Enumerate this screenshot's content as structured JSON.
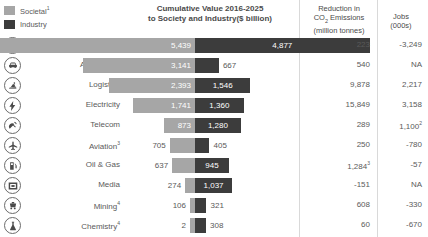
{
  "legend": {
    "items": [
      {
        "label": "Societal",
        "note": "1",
        "color": "#a6a6a6",
        "name": "societal"
      },
      {
        "label": "Industry",
        "note": "",
        "color": "#3c3c3c",
        "name": "industry"
      }
    ]
  },
  "headers": {
    "center_line1": "Cumulative Value 2016-2025",
    "center_line2": "to Society and Industry($ billion)",
    "co2_line1": "Reduction in",
    "co2_line2_pre": "CO",
    "co2_line2_sub": "2",
    "co2_line2_post": " Emissions",
    "co2_line3": "(million tonnes)",
    "jobs_line1": "Jobs",
    "jobs_line2": "(000s)"
  },
  "chart_data": {
    "type": "bar",
    "title": "Cumulative Value 2016-2025 to Society and Industry($ billion)",
    "xlabel": "",
    "ylabel": "",
    "orientation": "horizontal",
    "stacked": "diverging",
    "grid": false,
    "legend_position": "top-left",
    "categories": [
      "Consumer",
      "Automotive",
      "Logistics",
      "Electricity",
      "Telecom",
      "Aviation",
      "Oil & Gas",
      "Media",
      "Mining",
      "Chemistry"
    ],
    "series": [
      {
        "name": "Societal",
        "color": "#a6a6a6",
        "values": [
          5439,
          3141,
          2393,
          1741,
          873,
          705,
          637,
          274,
          106,
          2
        ]
      },
      {
        "name": "Industry",
        "color": "#3c3c3c",
        "values": [
          4877,
          667,
          1546,
          1360,
          1280,
          405,
          945,
          1037,
          321,
          308
        ]
      }
    ],
    "extra_columns": [
      {
        "name": "Reduction in CO2 Emissions (million tonnes)",
        "values": [
          "223",
          "540",
          "9,878",
          "15,849",
          "289",
          "250",
          "1,284",
          "-151",
          "608",
          "60"
        ]
      },
      {
        "name": "Jobs (000s)",
        "values": [
          "-3,249",
          "NA",
          "2,217",
          "3,158",
          "1,100",
          "-780",
          "-57",
          "NA",
          "-330",
          "-670"
        ]
      }
    ]
  },
  "rows": [
    {
      "icon": "shopping-bag-icon",
      "label": "Consumer",
      "note": "",
      "societal": "5,439",
      "industry": "4,877",
      "co2": "223",
      "co2_note": "",
      "jobs": "-3,249",
      "jobs_note": ""
    },
    {
      "icon": "car-icon",
      "label": "Automotive",
      "note": "",
      "societal": "3,141",
      "industry": "667",
      "co2": "540",
      "co2_note": "",
      "jobs": "NA",
      "jobs_note": ""
    },
    {
      "icon": "delivery-icon",
      "label": "Logistics",
      "note": "",
      "societal": "2,393",
      "industry": "1,546",
      "co2": "9,878",
      "co2_note": "",
      "jobs": "2,217",
      "jobs_note": ""
    },
    {
      "icon": "lightning-bolt-icon",
      "label": "Electricity",
      "note": "",
      "societal": "1,741",
      "industry": "1,360",
      "co2": "15,849",
      "co2_note": "",
      "jobs": "3,158",
      "jobs_note": ""
    },
    {
      "icon": "satellite-dish-icon",
      "label": "Telecom",
      "note": "",
      "societal": "873",
      "industry": "1,280",
      "co2": "289",
      "co2_note": "",
      "jobs": "1,100",
      "jobs_note": "2"
    },
    {
      "icon": "airplane-icon",
      "label": "Aviation",
      "note": "3",
      "societal": "705",
      "industry": "405",
      "co2": "250",
      "co2_note": "",
      "jobs": "-780",
      "jobs_note": ""
    },
    {
      "icon": "fuel-pump-icon",
      "label": "Oil & Gas",
      "note": "",
      "societal": "637",
      "industry": "945",
      "co2": "1,284",
      "co2_note": "3",
      "jobs": "-57",
      "jobs_note": ""
    },
    {
      "icon": "media-screen-icon",
      "label": "Media",
      "note": "",
      "societal": "274",
      "industry": "1,037",
      "co2": "-151",
      "co2_note": "",
      "jobs": "NA",
      "jobs_note": ""
    },
    {
      "icon": "mining-cart-icon",
      "label": "Mining",
      "note": "4",
      "societal": "106",
      "industry": "321",
      "co2": "608",
      "co2_note": "",
      "jobs": "-330",
      "jobs_note": ""
    },
    {
      "icon": "flask-icon",
      "label": "Chemistry",
      "note": "4",
      "societal": "2",
      "industry": "308",
      "co2": "60",
      "co2_note": "",
      "jobs": "-670",
      "jobs_note": ""
    }
  ],
  "layout": {
    "pivot_x": 195,
    "scale_px_per_unit": 0.0358,
    "inside_label_min_px": 26
  }
}
